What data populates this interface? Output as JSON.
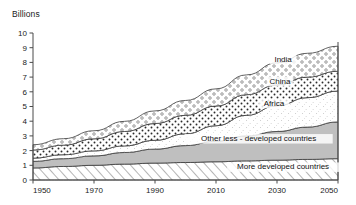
{
  "chart_data": {
    "type": "area",
    "title": "",
    "subtitle": "",
    "ylabel": "Billions",
    "xlabel": "",
    "stacked": true,
    "grid": false,
    "legend": "inline-labels",
    "xlim": [
      1950,
      2050
    ],
    "ylim": [
      0,
      10
    ],
    "xticks": [
      1950,
      1970,
      1990,
      2010,
      2030,
      2050
    ],
    "xtick_labels": [
      "1950",
      "1970",
      "1990",
      "2010",
      "2030",
      "2050"
    ],
    "yticks": [
      0,
      1,
      2,
      3,
      4,
      5,
      6,
      7,
      8,
      9,
      10
    ],
    "ytick_labels": [
      "0",
      "1",
      "2",
      "3",
      "4",
      "5",
      "6",
      "7",
      "8",
      "9",
      "10"
    ],
    "x": [
      1950,
      1960,
      1970,
      1980,
      1990,
      2000,
      2010,
      2020,
      2030,
      2040,
      2050
    ],
    "series": [
      {
        "name": "More developed countries",
        "label": "More developed countries",
        "pattern": "diagonal-hatch",
        "values": [
          0.82,
          0.92,
          1.0,
          1.08,
          1.15,
          1.19,
          1.24,
          1.3,
          1.35,
          1.4,
          1.45
        ]
      },
      {
        "name": "Other less - developed countries",
        "label": "Other less - developed countries",
        "pattern": "solid-grey",
        "values": [
          0.45,
          0.53,
          0.64,
          0.79,
          0.95,
          1.15,
          1.4,
          1.7,
          1.95,
          2.2,
          2.5
        ]
      },
      {
        "name": "Africa",
        "label": "Africa",
        "pattern": "fine-stipple",
        "values": [
          0.22,
          0.27,
          0.34,
          0.45,
          0.6,
          0.8,
          1.05,
          1.4,
          1.75,
          2.0,
          2.1
        ]
      },
      {
        "name": "China",
        "label": "China",
        "pattern": "dense-dots",
        "values": [
          0.55,
          0.65,
          0.82,
          0.98,
          1.14,
          1.26,
          1.34,
          1.4,
          1.42,
          1.4,
          1.35
        ]
      },
      {
        "name": "India",
        "label": "India",
        "pattern": "open-circles",
        "values": [
          0.36,
          0.44,
          0.55,
          0.69,
          0.86,
          1.01,
          1.17,
          1.35,
          1.5,
          1.62,
          1.7
        ]
      }
    ],
    "totals": [
      2.4,
      2.81,
      3.35,
      3.99,
      4.7,
      5.41,
      6.2,
      7.15,
      7.97,
      8.62,
      9.1
    ],
    "series_label_positions": [
      {
        "name": "India",
        "x": 2032,
        "y": 8.05
      },
      {
        "name": "China",
        "x": 2031,
        "y": 6.55
      },
      {
        "name": "Africa",
        "x": 2029,
        "y": 5.05
      },
      {
        "name": "Other less - developed countries",
        "x": 2024,
        "y": 2.65
      },
      {
        "name": "More developed countries",
        "x": 2032,
        "y": 0.72
      }
    ],
    "colors": {
      "axis": "#4a4a4a",
      "text": "#1a1a1a",
      "band_edge": "#3b3b3b",
      "grey_fill": "#bfbfbf",
      "white_fill": "#ffffff",
      "hatch_line": "#555555",
      "dot": "#2b2b2b"
    }
  }
}
